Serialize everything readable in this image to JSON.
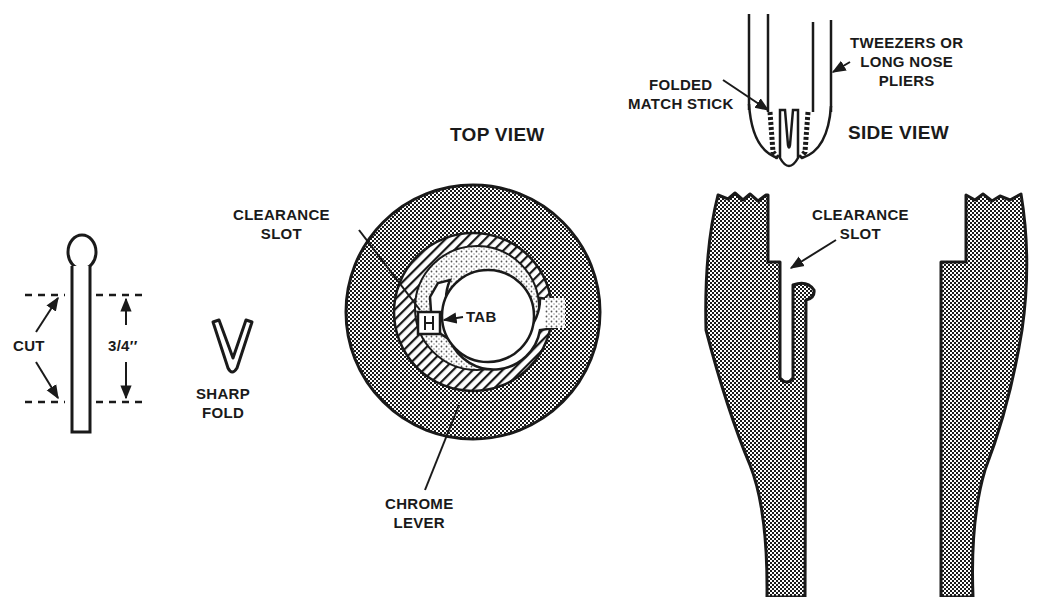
{
  "diagram": {
    "colors": {
      "ink": "#1a1a1a",
      "background": "#ffffff",
      "dense_stipple": "#6e6e6e",
      "light_stipple": "#cfcfcf"
    },
    "match_stick": {
      "cut_label": "CUT",
      "dimension_label": "3/4′′"
    },
    "fold": {
      "label_line1": "SHARP",
      "label_line2": "FOLD"
    },
    "top_view": {
      "title": "TOP VIEW",
      "clearance_slot_line1": "CLEARANCE",
      "clearance_slot_line2": "SLOT",
      "tab_label": "TAB",
      "chrome_lever_line1": "CHROME",
      "chrome_lever_line2": "LEVER"
    },
    "tool": {
      "folded_match_line1": "FOLDED",
      "folded_match_line2": "MATCH STICK",
      "tweezers_line1": "TWEEZERS OR",
      "tweezers_line2": "LONG NOSE",
      "tweezers_line3": "PLIERS"
    },
    "side_view": {
      "title": "SIDE VIEW",
      "clearance_slot_line1": "CLEARANCE",
      "clearance_slot_line2": "SLOT"
    }
  }
}
